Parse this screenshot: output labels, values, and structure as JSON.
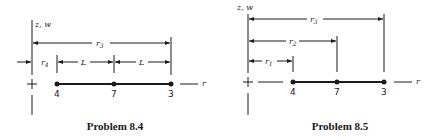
{
  "figures": [
    {
      "id": "problem-8-4",
      "caption": "Problem 8.4",
      "axis_label": "z, w",
      "radial_label": "r",
      "nodes": [
        {
          "label": "4"
        },
        {
          "label": "7"
        },
        {
          "label": "3"
        }
      ],
      "dimensions": [
        {
          "label_main": "r",
          "label_sub": "3",
          "spans": "axis to node 3"
        },
        {
          "label_main": "r",
          "label_sub": "4",
          "spans": "axis to node 4"
        },
        {
          "label_main": "L",
          "label_sub": "",
          "spans": "node 4 to node 7"
        },
        {
          "label_main": "L",
          "label_sub": "",
          "spans": "node 7 to node 3"
        }
      ]
    },
    {
      "id": "problem-8-5",
      "caption": "Problem 8.5",
      "axis_label": "z, w",
      "radial_label": "r",
      "nodes": [
        {
          "label": "4"
        },
        {
          "label": "7"
        },
        {
          "label": "3"
        }
      ],
      "dimensions": [
        {
          "label_main": "r",
          "label_sub": "3",
          "spans": "axis to node 3"
        },
        {
          "label_main": "r",
          "label_sub": "2",
          "spans": "axis to node 7"
        },
        {
          "label_main": "r",
          "label_sub": "1",
          "spans": "axis to node 4"
        }
      ]
    }
  ]
}
